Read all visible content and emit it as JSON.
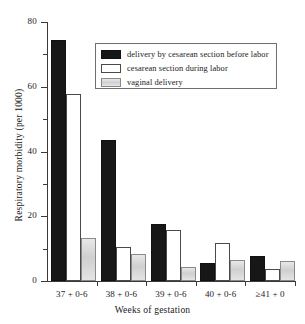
{
  "chart_data": {
    "type": "bar",
    "title": "",
    "xlabel": "Weeks of gestation",
    "ylabel": "Respiratory morbidity (per 1000)",
    "categories": [
      "37 + 0-6",
      "38 + 0-6",
      "39 + 0-6",
      "40 + 0-6",
      "≥41 + 0"
    ],
    "series": [
      {
        "name": "delivery by cesarean section before labor",
        "color": "#171717",
        "values": [
          73.8,
          42.9,
          17.0,
          5.0,
          7.0
        ]
      },
      {
        "name": "cesarean section during labor",
        "color": "#ffffff",
        "values": [
          57.0,
          10.0,
          15.2,
          11.0,
          3.0
        ]
      },
      {
        "name": "vaginal delivery",
        "color": "#d6d6d6",
        "values": [
          12.8,
          7.6,
          3.6,
          6.0,
          5.5
        ]
      }
    ],
    "ylim": [
      0,
      80
    ],
    "yticks": [
      0,
      20,
      40,
      60,
      80
    ],
    "yticks_minor": [
      10,
      30,
      50,
      70
    ],
    "ytick_labels": [
      "0",
      "20",
      "40",
      "60",
      "80"
    ],
    "grid": false,
    "legend_position": "top-right-inset"
  },
  "axes": {
    "y_title": "Respiratory morbidity (per 1000)",
    "x_title": "Weeks of gestation"
  },
  "legend": {
    "items": [
      {
        "label": "delivery by cesarean section before labor",
        "swatch": "solid-black-swatch"
      },
      {
        "label": "cesarean section during labor",
        "swatch": "outlined-white-swatch"
      },
      {
        "label": "vaginal delivery",
        "swatch": "light-gray-swatch"
      }
    ]
  }
}
